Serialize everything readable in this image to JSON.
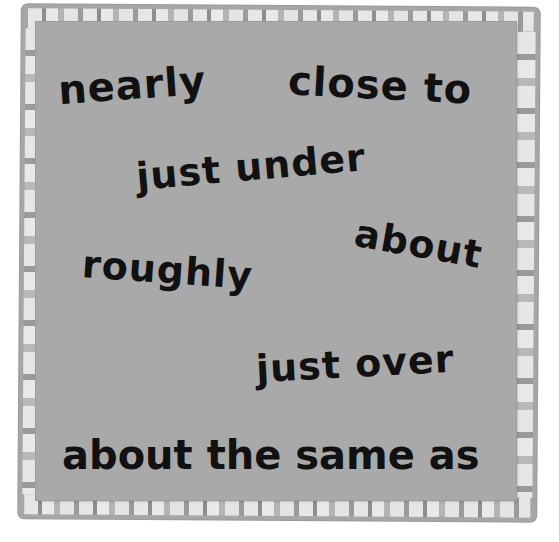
{
  "card": {
    "colors": {
      "panel": "#a9a9a9",
      "border": "#a6a6a6",
      "stripe_light": "#e6e6e6",
      "stripe_dark": "#8e8e8e",
      "text": "#111111"
    },
    "phrases": [
      {
        "text": "nearly"
      },
      {
        "text": "close to"
      },
      {
        "text": "just under"
      },
      {
        "text": "about"
      },
      {
        "text": "roughly"
      },
      {
        "text": "just over"
      },
      {
        "text": "about the same as"
      }
    ]
  }
}
